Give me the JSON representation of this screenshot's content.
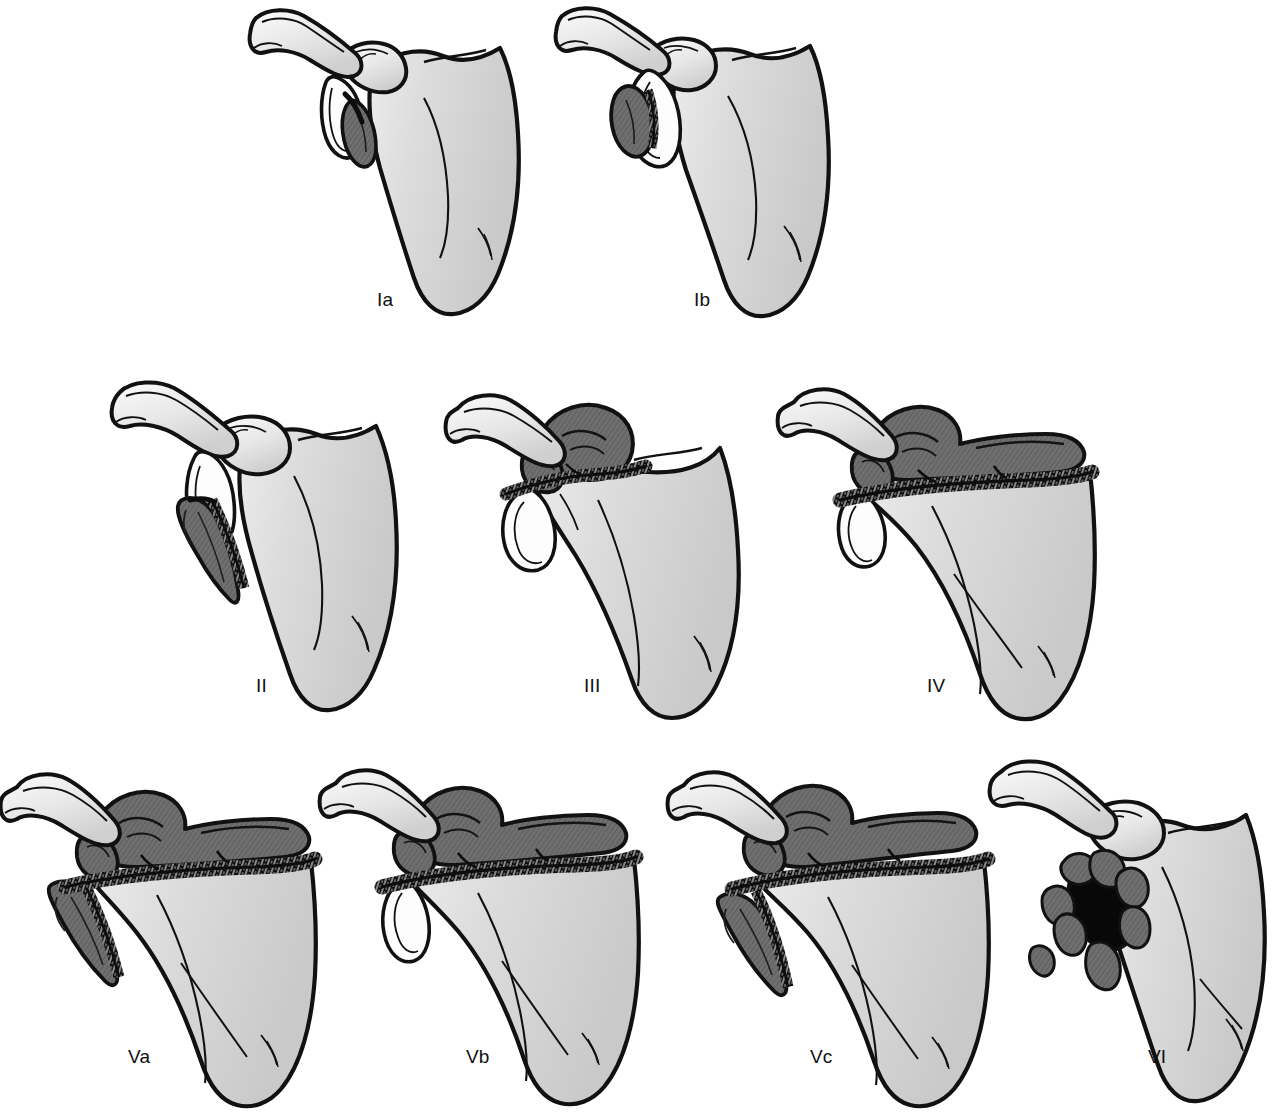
{
  "figure": {
    "background_color": "#ffffff",
    "ink_color": "#111111",
    "bone_fill_light": "#d2d2d2",
    "bone_fill_highlight": "#efefef",
    "fragment_fill_dark": "#6e6e6e",
    "fracture_line_color": "#0d0d0d",
    "label_color": "#101010",
    "label_font_size_px": 19,
    "rows": 3,
    "columns_per_row": [
      2,
      3,
      4
    ]
  },
  "panels": [
    {
      "id": "Ia",
      "label": "Ia",
      "row": 1,
      "col": 1,
      "label_x": 377,
      "label_y": 290,
      "origin_x": 248,
      "origin_y": 6,
      "scale": 1.0,
      "description": "Anterior glenoid rim fracture, small avulsed fragment",
      "features": [
        "clavicle",
        "acromion",
        "coracoid",
        "glenoid",
        "scapular-body",
        "spine-of-scapula",
        "dark-rim-fragment"
      ],
      "fragment_style": "dark-small-rim-fragment",
      "has_transverse_fracture_band": false,
      "has_comminution": false
    },
    {
      "id": "Ib",
      "label": "Ib",
      "row": 1,
      "col": 2,
      "label_x": 694,
      "label_y": 290,
      "origin_x": 556,
      "origin_y": 6,
      "scale": 1.0,
      "description": "Posterior glenoid rim fracture, displaced rim fragment",
      "features": [
        "clavicle",
        "acromion",
        "coracoid",
        "glenoid",
        "scapular-body",
        "spine-of-scapula",
        "dark-rim-fragment"
      ],
      "fragment_style": "dark-displaced-rim-fragment",
      "has_transverse_fracture_band": false,
      "has_comminution": false
    },
    {
      "id": "II",
      "label": "II",
      "row": 2,
      "col": 1,
      "label_x": 256,
      "label_y": 676,
      "origin_x": 112,
      "origin_y": 378,
      "scale": 1.0,
      "description": "Transverse fracture through the glenoid fossa exiting the lateral scapular border; inferior triangular fragment",
      "features": [
        "clavicle",
        "acromion",
        "coracoid",
        "glenoid",
        "scapular-body",
        "inferior-triangular-fragment"
      ],
      "fragment_style": "dark-inferior-triangle",
      "has_transverse_fracture_band": false,
      "has_comminution": false
    },
    {
      "id": "III",
      "label": "III",
      "row": 2,
      "col": 2,
      "label_x": 584,
      "label_y": 676,
      "origin_x": 448,
      "origin_y": 378,
      "scale": 1.0,
      "description": "Oblique fracture of the glenoid exiting the superior border of the scapula, often with acromioclavicular injury",
      "features": [
        "clavicle",
        "acromion",
        "coracoid-fragment",
        "glenoid",
        "scapular-body",
        "superior-fragment"
      ],
      "fragment_style": "dark-superior-coracoid-block",
      "has_transverse_fracture_band": true,
      "has_comminution": false
    },
    {
      "id": "IV",
      "label": "IV",
      "row": 2,
      "col": 3,
      "label_x": 927,
      "label_y": 676,
      "origin_x": 790,
      "origin_y": 378,
      "scale": 1.0,
      "description": "Transverse fracture exiting the medial border of the scapula",
      "features": [
        "clavicle",
        "acromion",
        "coracoid-fragment",
        "glenoid",
        "scapular-body",
        "superior-fragment",
        "medial-exit-fracture"
      ],
      "fragment_style": "dark-superior-block-full-width",
      "has_transverse_fracture_band": true,
      "has_comminution": false
    },
    {
      "id": "Va",
      "label": "Va",
      "row": 3,
      "col": 1,
      "label_x": 128,
      "label_y": 1047,
      "origin_x": 5,
      "origin_y": 757,
      "scale": 1.0,
      "description": "Type IV fracture combined with a type II fracture (inferior glenoid fragment)",
      "features": [
        "clavicle",
        "acromion",
        "coracoid-fragment",
        "glenoid",
        "scapular-body",
        "superior-fragment",
        "inferior-triangular-fragment",
        "medial-exit-fracture"
      ],
      "fragment_style": "dark-superior-block-plus-inferior-triangle",
      "has_transverse_fracture_band": true,
      "has_comminution": false
    },
    {
      "id": "Vb",
      "label": "Vb",
      "row": 3,
      "col": 2,
      "label_x": 466,
      "label_y": 1047,
      "origin_x": 330,
      "origin_y": 757,
      "scale": 1.0,
      "description": "Type IV fracture combined with a type III fracture (superior glenoid fragment)",
      "features": [
        "clavicle",
        "acromion",
        "coracoid-fragment",
        "glenoid",
        "scapular-body",
        "superior-fragment",
        "medial-exit-fracture"
      ],
      "fragment_style": "dark-superior-block-full-width",
      "has_transverse_fracture_band": true,
      "has_comminution": false
    },
    {
      "id": "Vc",
      "label": "Vc",
      "row": 3,
      "col": 3,
      "label_x": 810,
      "label_y": 1047,
      "origin_x": 672,
      "origin_y": 757,
      "scale": 1.0,
      "description": "Combination of type II, III and IV fracture patterns",
      "features": [
        "clavicle",
        "acromion",
        "coracoid-fragment",
        "glenoid",
        "scapular-body",
        "superior-fragment",
        "inferior-triangular-fragment",
        "medial-exit-fracture"
      ],
      "fragment_style": "dark-superior-block-plus-inferior-triangle",
      "has_transverse_fracture_band": true,
      "has_comminution": false
    },
    {
      "id": "VI",
      "label": "VI",
      "row": 3,
      "col": 4,
      "label_x": 1148,
      "label_y": 1047,
      "origin_x": 990,
      "origin_y": 757,
      "scale": 1.0,
      "description": "Comminuted fracture of the glenoid surface with multiple small fragments",
      "features": [
        "clavicle",
        "acromion",
        "coracoid",
        "glenoid",
        "scapular-body",
        "comminuted-fragments"
      ],
      "fragment_style": "comminuted-multi-fragment",
      "has_transverse_fracture_band": false,
      "has_comminution": true
    }
  ]
}
